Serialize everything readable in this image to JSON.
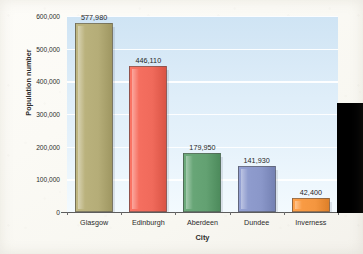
{
  "chart_data": {
    "type": "bar",
    "title": "",
    "xlabel": "City",
    "ylabel": "Population number",
    "categories": [
      "Glasgow",
      "Edinburgh",
      "Aberdeen",
      "Dundee",
      "Inverness"
    ],
    "values": [
      577980,
      446110,
      179950,
      141930,
      42400
    ],
    "value_labels": [
      "577,980",
      "446,110",
      "179,950",
      "141,930",
      "42,400"
    ],
    "ylim": [
      0,
      600000
    ],
    "ytick_values": [
      0,
      100000,
      200000,
      300000,
      400000,
      500000,
      600000
    ],
    "ytick_labels": [
      "0",
      "100,000",
      "200,000",
      "300,000",
      "400,000",
      "500,000",
      "600,000"
    ],
    "grid": "horizontal",
    "legend": "none",
    "bar_colors": [
      "#b5ad78",
      "#f06a5b",
      "#63a172",
      "#8a97c9",
      "#f4963f"
    ],
    "plot_background": "#d9ebf7",
    "gridline_color": "#ffffff",
    "page_background": "#fbfaf5",
    "axis_color": "#5d5d5d",
    "text_color": "#2b2b2b"
  },
  "overlay": {
    "black_block_color": "#000000"
  }
}
